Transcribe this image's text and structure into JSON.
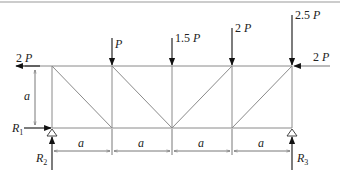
{
  "diagram": {
    "colors": {
      "member": "#8a8a8a",
      "arrow": "#111111",
      "text": "#222222",
      "frame": "#9a9a9a"
    },
    "loads": [
      {
        "id": "load-left-horizontal",
        "coef": "2",
        "sym": "P",
        "direction": "left",
        "node": "top-left"
      },
      {
        "id": "load-1",
        "coef": "",
        "sym": "P",
        "direction": "down",
        "node": "top-2"
      },
      {
        "id": "load-2",
        "coef": "1.5",
        "sym": "P",
        "direction": "down",
        "node": "top-3"
      },
      {
        "id": "load-3",
        "coef": "2",
        "sym": "P",
        "direction": "down",
        "node": "top-4"
      },
      {
        "id": "load-4",
        "coef": "2.5",
        "sym": "P",
        "direction": "down",
        "node": "top-5"
      },
      {
        "id": "load-right-horizontal",
        "coef": "2",
        "sym": "P",
        "direction": "left",
        "node": "top-5"
      }
    ],
    "reactions": {
      "r1": {
        "sym": "R",
        "sub": "1",
        "direction": "right"
      },
      "r2": {
        "sym": "R",
        "sub": "2",
        "direction": "up"
      },
      "r3": {
        "sym": "R",
        "sub": "3",
        "direction": "up"
      }
    },
    "dimensions": {
      "height_label": "a",
      "spans": [
        "a",
        "a",
        "a",
        "a"
      ]
    }
  }
}
